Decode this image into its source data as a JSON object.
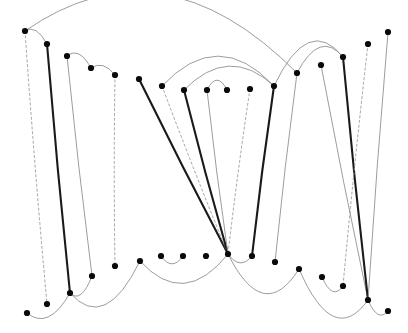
{
  "figure": {
    "title": "",
    "canvas": {
      "width": 408,
      "height": 333,
      "background": "#ffffff"
    },
    "style": {
      "node_color": "#0a0a0a",
      "node_radius": 3.1,
      "thick_edge_color": "#1a1a1a",
      "thin_edge_color": "#8a8a8a",
      "dashed_edge_color": "#9a9a9a",
      "thick_edge_width": 2.1,
      "thin_edge_width": 0.85,
      "dashed_edge_width": 0.9
    },
    "nodes": [
      {
        "id": "n0",
        "x": 25,
        "y": 31,
        "label": ""
      },
      {
        "id": "n1",
        "x": 47,
        "y": 44,
        "label": ""
      },
      {
        "id": "n2",
        "x": 67,
        "y": 56,
        "label": ""
      },
      {
        "id": "n3",
        "x": 91,
        "y": 68,
        "label": ""
      },
      {
        "id": "n4",
        "x": 115,
        "y": 75,
        "label": ""
      },
      {
        "id": "n5",
        "x": 139,
        "y": 79,
        "label": ""
      },
      {
        "id": "n6",
        "x": 162,
        "y": 86,
        "label": ""
      },
      {
        "id": "n7",
        "x": 184,
        "y": 90,
        "label": ""
      },
      {
        "id": "n8",
        "x": 207,
        "y": 90,
        "label": ""
      },
      {
        "id": "n9",
        "x": 227,
        "y": 90,
        "label": ""
      },
      {
        "id": "n10",
        "x": 250,
        "y": 89,
        "label": ""
      },
      {
        "id": "n11",
        "x": 274,
        "y": 86,
        "label": ""
      },
      {
        "id": "n12",
        "x": 297,
        "y": 73,
        "label": ""
      },
      {
        "id": "n13",
        "x": 321,
        "y": 65,
        "label": ""
      },
      {
        "id": "n14",
        "x": 343,
        "y": 57,
        "label": ""
      },
      {
        "id": "n15",
        "x": 368,
        "y": 44,
        "label": ""
      },
      {
        "id": "n16",
        "x": 388,
        "y": 32,
        "label": ""
      },
      {
        "id": "m0",
        "x": 27,
        "y": 313,
        "label": ""
      },
      {
        "id": "m1",
        "x": 47,
        "y": 304,
        "label": ""
      },
      {
        "id": "m2",
        "x": 70,
        "y": 293,
        "label": ""
      },
      {
        "id": "m3",
        "x": 92,
        "y": 276,
        "label": ""
      },
      {
        "id": "m4",
        "x": 115,
        "y": 266,
        "label": ""
      },
      {
        "id": "m5",
        "x": 140,
        "y": 261,
        "label": ""
      },
      {
        "id": "m6",
        "x": 161,
        "y": 256,
        "label": ""
      },
      {
        "id": "m7",
        "x": 183,
        "y": 256,
        "label": ""
      },
      {
        "id": "m8",
        "x": 206,
        "y": 256,
        "label": ""
      },
      {
        "id": "m9",
        "x": 228,
        "y": 254,
        "label": ""
      },
      {
        "id": "m10",
        "x": 252,
        "y": 256,
        "label": ""
      },
      {
        "id": "m11",
        "x": 275,
        "y": 262,
        "label": ""
      },
      {
        "id": "m12",
        "x": 299,
        "y": 269,
        "label": ""
      },
      {
        "id": "m13",
        "x": 322,
        "y": 277,
        "label": ""
      },
      {
        "id": "m14",
        "x": 343,
        "y": 286,
        "label": ""
      },
      {
        "id": "m15",
        "x": 368,
        "y": 300,
        "label": ""
      },
      {
        "id": "m16",
        "x": 388,
        "y": 311,
        "label": ""
      }
    ],
    "long_edges": [
      {
        "from": "n0",
        "to": "m1",
        "style": "dashed"
      },
      {
        "from": "n1",
        "to": "m2",
        "style": "thick"
      },
      {
        "from": "n2",
        "to": "m3",
        "style": "thin"
      },
      {
        "from": "n4",
        "to": "m4",
        "style": "dashed"
      },
      {
        "from": "n5",
        "to": "m9",
        "style": "thick"
      },
      {
        "from": "n6",
        "to": "m9",
        "style": "dashed"
      },
      {
        "from": "n7",
        "to": "m9",
        "style": "thick"
      },
      {
        "from": "n8",
        "to": "m9",
        "style": "thin"
      },
      {
        "from": "n10",
        "to": "m9",
        "style": "dashed"
      },
      {
        "from": "n11",
        "to": "m10",
        "style": "thick"
      },
      {
        "from": "n12",
        "to": "m11",
        "style": "thin"
      },
      {
        "from": "n13",
        "to": "m15",
        "style": "thin"
      },
      {
        "from": "n14",
        "to": "m15",
        "style": "thick"
      },
      {
        "from": "n15",
        "to": "m14",
        "style": "dashed"
      },
      {
        "from": "n16",
        "to": "m15",
        "style": "thin"
      }
    ],
    "arcs_top": [
      {
        "from": "n0",
        "to": "n12",
        "style": "thin",
        "bow": 58
      },
      {
        "from": "n0",
        "to": "n1",
        "style": "thin",
        "bow": 7
      },
      {
        "from": "n2",
        "to": "n3",
        "style": "thin",
        "bow": 8
      },
      {
        "from": "n3",
        "to": "n4",
        "style": "thin",
        "bow": 6
      },
      {
        "from": "n6",
        "to": "n11",
        "style": "thin",
        "bow": 30
      },
      {
        "from": "n7",
        "to": "n11",
        "style": "thin",
        "bow": 22
      },
      {
        "from": "n8",
        "to": "n9",
        "style": "thin",
        "bow": 10
      },
      {
        "from": "n11",
        "to": "n14",
        "style": "thin",
        "bow": 29
      },
      {
        "from": "n12",
        "to": "n14",
        "style": "thin",
        "bow": 18
      }
    ],
    "arcs_bottom": [
      {
        "from": "m0",
        "to": "m2",
        "style": "thin",
        "bow": 14
      },
      {
        "from": "m2",
        "to": "m5",
        "style": "thin",
        "bow": 28
      },
      {
        "from": "m3",
        "to": "m2",
        "style": "thin",
        "bow": 10
      },
      {
        "from": "m5",
        "to": "m9",
        "style": "thin",
        "bow": 26
      },
      {
        "from": "m6",
        "to": "m7",
        "style": "thin",
        "bow": 8
      },
      {
        "from": "m9",
        "to": "m10",
        "style": "thin",
        "bow": 8
      },
      {
        "from": "m9",
        "to": "m12",
        "style": "thin",
        "bow": 32
      },
      {
        "from": "m12",
        "to": "m15",
        "style": "thin",
        "bow": 32
      },
      {
        "from": "m13",
        "to": "m14",
        "style": "thin",
        "bow": 10
      },
      {
        "from": "m15",
        "to": "m16",
        "style": "thin",
        "bow": 9
      }
    ]
  }
}
